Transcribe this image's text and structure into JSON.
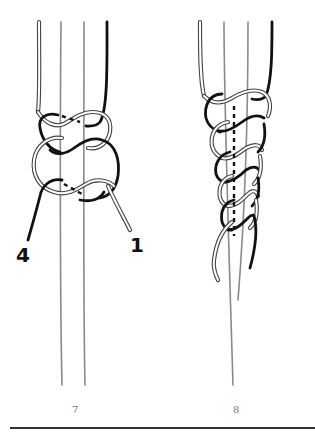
{
  "figures": [
    {
      "id": "fig-7",
      "caption": "7",
      "strand_labels": {
        "left": "4",
        "right": "1"
      }
    },
    {
      "id": "fig-8",
      "caption": "8"
    }
  ],
  "colors": {
    "background": "#ffffff",
    "dark_strand": "#111111",
    "light_strand_outline": "#444444",
    "core_strand": "#8a8a8a",
    "caption": "#777777",
    "divider": "#333333"
  }
}
